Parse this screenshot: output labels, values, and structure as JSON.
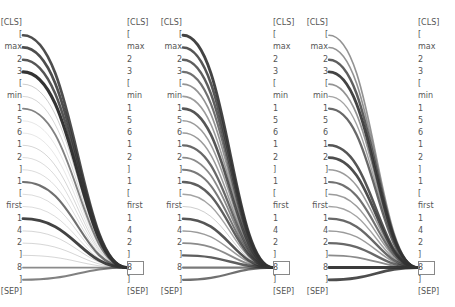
{
  "tokens": [
    "[CLS]",
    "[",
    "max",
    "2",
    "3",
    "[",
    "min",
    "1",
    "5",
    "6",
    "1",
    "2",
    "]",
    "1",
    "[",
    "first",
    "1",
    "4",
    "2",
    "]",
    "8",
    "]",
    "[SEP]"
  ],
  "target_index": 20,
  "target_token": "8",
  "layout": {
    "row_top": 23,
    "row_step": 12.23
  },
  "line_color": "#333333",
  "panels": [
    {
      "name": "panel-1",
      "left_text_right_edge": 22,
      "right_text_left": 127,
      "curve_start_x": 23,
      "curve_end_x": 127,
      "weights": [
        0,
        0.85,
        0.85,
        0.8,
        1.0,
        0.15,
        0.12,
        0.55,
        0.05,
        0.05,
        0.12,
        0.1,
        0.1,
        0.65,
        0.1,
        0.1,
        0.9,
        0.12,
        0.12,
        0.12,
        0.5,
        0.55,
        0
      ]
    },
    {
      "name": "panel-2",
      "left_text_right_edge": 182,
      "right_text_left": 273,
      "curve_start_x": 183,
      "curve_end_x": 273,
      "weights": [
        0,
        0.9,
        0.8,
        0.75,
        0.65,
        0.45,
        0.4,
        0.8,
        0.4,
        0.4,
        0.7,
        0.5,
        0.6,
        0.75,
        0.35,
        0.15,
        0.8,
        0.4,
        0.5,
        0.75,
        0.6,
        0.65,
        0
      ]
    },
    {
      "name": "panel-3",
      "left_text_right_edge": 328,
      "right_text_left": 418,
      "curve_start_x": 329,
      "curve_end_x": 418,
      "weights": [
        0,
        0.45,
        0.45,
        0.75,
        0.9,
        0.45,
        0.35,
        0.7,
        0,
        0,
        0.8,
        0.85,
        0.4,
        0.65,
        0.4,
        0.35,
        0.7,
        0.4,
        0.7,
        0.5,
        0.95,
        0.85,
        0
      ]
    }
  ]
}
